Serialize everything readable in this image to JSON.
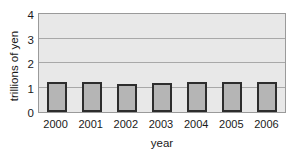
{
  "chart_data": {
    "type": "bar",
    "title": "",
    "subtitle": "",
    "xlabel": "year",
    "ylabel": "trillions of yen",
    "categories": [
      "2000",
      "2001",
      "2002",
      "2003",
      "2004",
      "2005",
      "2006"
    ],
    "values": [
      1.22,
      1.21,
      1.15,
      1.18,
      1.21,
      1.21,
      1.21
    ],
    "ylim": [
      0,
      4
    ],
    "yticks": [
      "0",
      "1",
      "2",
      "3",
      "4"
    ],
    "ytick_values": [
      0,
      1,
      2,
      3,
      4
    ],
    "gridlines": [
      1,
      2,
      3
    ],
    "grid": true,
    "legend": null,
    "legend_position": "none",
    "annotations": [],
    "series": [
      {
        "name": "trillions of yen",
        "values": [
          1.22,
          1.21,
          1.15,
          1.18,
          1.21,
          1.21,
          1.21
        ]
      }
    ]
  },
  "style": {
    "plot_background": "#e8e8e8",
    "plot_border": "#9a9a9a",
    "gridline_color": "#a8a8a8",
    "bar_fill": "#b5b5b5",
    "bar_outline": "#2d2d2d",
    "text_color": "#1a1a1a",
    "page_background": "#ffffff"
  }
}
